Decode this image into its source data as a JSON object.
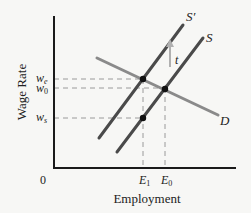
{
  "diagram": {
    "type": "supply-demand-tax-incidence",
    "axes": {
      "ylabel": "Wage Rate",
      "xlabel": "Employment",
      "origin": "0"
    },
    "curves": {
      "supply_shifted": {
        "label": "S",
        "prime": "′"
      },
      "supply": {
        "label": "S"
      },
      "demand": {
        "label": "D"
      }
    },
    "shift_label": "t",
    "y_ticks": [
      {
        "base": "w",
        "sub": "e"
      },
      {
        "base": "w",
        "sub": "0"
      },
      {
        "base": "w",
        "sub": "s"
      }
    ],
    "x_ticks": [
      {
        "base": "E",
        "sub": "1"
      },
      {
        "base": "E",
        "sub": "0"
      }
    ],
    "colors": {
      "supply": "#4a4a4a",
      "demand": "#8a8a8a",
      "axis": "#1a1a1a",
      "dashed": "#999999",
      "arrow": "#aaaaaa",
      "point": "#111111"
    }
  }
}
